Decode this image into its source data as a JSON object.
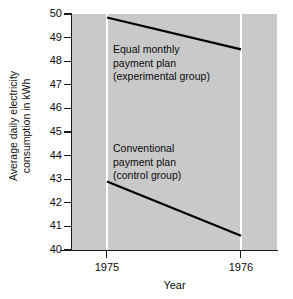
{
  "chart_data": {
    "type": "line",
    "title": "",
    "xlabel": "Year",
    "ylabel": "Average daily electricity consumption in kWh",
    "ylabel_line1": "Average daily electricity",
    "ylabel_line2": "consumption in kWh",
    "x": [
      "1975",
      "1976"
    ],
    "xlim": [
      "1975",
      "1976"
    ],
    "ylim": [
      40,
      50
    ],
    "yticks": [
      50,
      49,
      48,
      47,
      46,
      45,
      44,
      43,
      42,
      41,
      40
    ],
    "ytick_labels": [
      "50",
      "49",
      "48",
      "47",
      "46",
      "45",
      "44",
      "43",
      "42",
      "41",
      "40"
    ],
    "xticks": [
      "1975",
      "1976"
    ],
    "grid": "vertical-white-at-xticks",
    "legend": "inline-annotations",
    "plot_bgcolor": "#c9c9c9",
    "line_color": "#000000",
    "gridline_color": "#ffffff",
    "series": [
      {
        "name": "Equal monthly payment plan (experimental group)",
        "annotation_line1": "Equal monthly",
        "annotation_line2": "payment plan",
        "annotation_line3": "(experimental group)",
        "values": [
          49.85,
          48.5
        ]
      },
      {
        "name": "Conventional payment plan (control group)",
        "annotation_line1": "Conventional",
        "annotation_line2": "payment plan",
        "annotation_line3": "(control group)",
        "values": [
          42.9,
          40.6
        ]
      }
    ]
  }
}
